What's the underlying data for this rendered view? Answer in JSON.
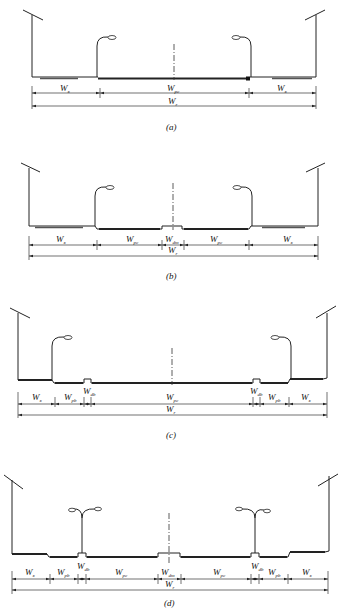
{
  "panels": [
    {
      "caption": "(a)",
      "segments": [
        {
          "main": "W",
          "sub": "x"
        },
        {
          "main": "W",
          "sub": "pc"
        },
        {
          "main": "W",
          "sub": "x"
        }
      ],
      "total": {
        "main": "W",
        "sub": "r"
      }
    },
    {
      "caption": "(b)",
      "segments": [
        {
          "main": "W",
          "sub": "x"
        },
        {
          "main": "W",
          "sub": "pc"
        },
        {
          "main": "W",
          "sub": "dm"
        },
        {
          "main": "W",
          "sub": "pc"
        },
        {
          "main": "W",
          "sub": "x"
        }
      ],
      "total": {
        "main": "W",
        "sub": "r"
      }
    },
    {
      "caption": "(c)",
      "segments": [
        {
          "main": "W",
          "sub": "x"
        },
        {
          "main": "W",
          "sub": "pb"
        },
        {
          "main": "W",
          "sub": "db"
        },
        {
          "main": "W",
          "sub": "pc"
        },
        {
          "main": "W",
          "sub": "db"
        },
        {
          "main": "W",
          "sub": "pb"
        },
        {
          "main": "W",
          "sub": "x"
        }
      ],
      "total": {
        "main": "W",
        "sub": "r"
      }
    },
    {
      "caption": "(d)",
      "segments": [
        {
          "main": "W",
          "sub": "x"
        },
        {
          "main": "W",
          "sub": "pb"
        },
        {
          "main": "W",
          "sub": "db"
        },
        {
          "main": "W",
          "sub": "pc"
        },
        {
          "main": "W",
          "sub": "dm"
        },
        {
          "main": "W",
          "sub": "pc"
        },
        {
          "main": "W",
          "sub": "db"
        },
        {
          "main": "W",
          "sub": "pb"
        },
        {
          "main": "W",
          "sub": "x"
        }
      ],
      "total": {
        "main": "W",
        "sub": "r"
      }
    }
  ]
}
